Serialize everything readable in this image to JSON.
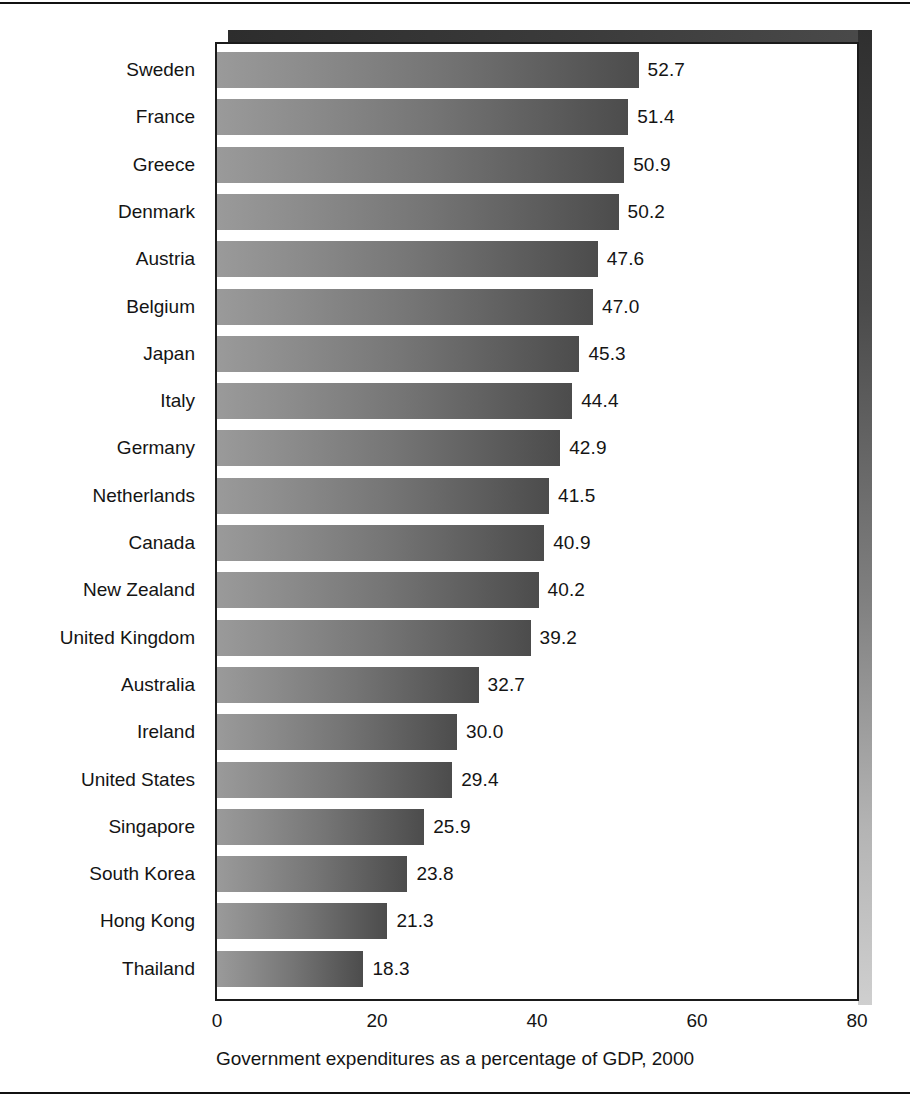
{
  "chart_data": {
    "type": "bar",
    "orientation": "horizontal",
    "title": "",
    "xlabel": "Government expenditures as a percentage of GDP, 2000",
    "ylabel": "",
    "xlim": [
      0,
      80
    ],
    "xticks": [
      0,
      20,
      40,
      60,
      80
    ],
    "xtick_labels": [
      "0",
      "20",
      "40",
      "60",
      "80"
    ],
    "grid": false,
    "legend": "none",
    "value_label_format": "one-decimal",
    "categories": [
      "Sweden",
      "France",
      "Greece",
      "Denmark",
      "Austria",
      "Belgium",
      "Japan",
      "Italy",
      "Germany",
      "Netherlands",
      "Canada",
      "New Zealand",
      "United Kingdom",
      "Australia",
      "Ireland",
      "United States",
      "Singapore",
      "South Korea",
      "Hong Kong",
      "Thailand"
    ],
    "values": [
      52.7,
      51.4,
      50.9,
      50.2,
      47.6,
      47.0,
      45.3,
      44.4,
      42.9,
      41.5,
      40.9,
      40.2,
      39.2,
      32.7,
      30.0,
      29.4,
      25.9,
      23.8,
      21.3,
      18.3
    ],
    "value_labels": [
      "52.7",
      "51.4",
      "50.9",
      "50.2",
      "47.6",
      "47.0",
      "45.3",
      "44.4",
      "42.9",
      "41.5",
      "40.9",
      "40.2",
      "39.2",
      "32.7",
      "30.0",
      "29.4",
      "25.9",
      "23.8",
      "21.3",
      "18.3"
    ]
  },
  "style": {
    "bar_gradient_start": "#9a9a9a",
    "bar_gradient_end": "#4c4c4c",
    "panel_background": "#ffffff",
    "panel_border": "#1b1b1b",
    "shadow_dark": "#2f2f2f",
    "shadow_light": "#cfcfcf",
    "text_color": "#141414",
    "rule_color": "#111111"
  }
}
